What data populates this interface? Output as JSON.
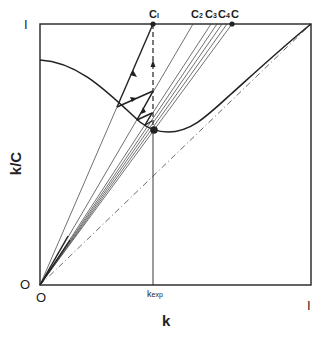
{
  "figure": {
    "x_axis_label": "k",
    "y_axis_label": "k/C",
    "x_ticks": {
      "origin": "O",
      "mid": "k",
      "mid_sub": "exp",
      "end": "I"
    },
    "y_ticks": {
      "origin": "O",
      "end": "I"
    },
    "top_labels": [
      {
        "id": "c1",
        "text": "C",
        "sub": "I"
      },
      {
        "id": "c2",
        "text": "C",
        "sub": "2"
      },
      {
        "id": "c3",
        "text": "C",
        "sub": "3"
      },
      {
        "id": "c4",
        "text": "C",
        "sub": "4"
      },
      {
        "id": "c",
        "text": "C",
        "sub": ""
      }
    ],
    "colors": {
      "ink": "#222222",
      "background": "#ffffff"
    }
  }
}
